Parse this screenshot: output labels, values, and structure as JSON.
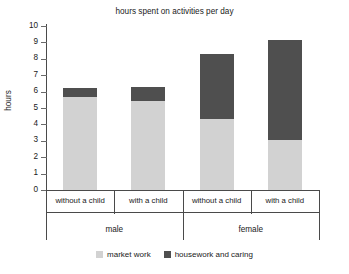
{
  "chart_data": {
    "type": "bar",
    "subtype": "stacked-bar",
    "title": "hours spent on activities per day",
    "xlabel": "",
    "ylabel": "hours",
    "ylim": [
      0,
      10
    ],
    "ytick_labels": [
      "0",
      "1",
      "2",
      "3",
      "4",
      "5",
      "6",
      "7",
      "8",
      "9",
      "10"
    ],
    "ytick_values": [
      0,
      1,
      2,
      3,
      4,
      5,
      6,
      7,
      8,
      9,
      10
    ],
    "grid": false,
    "legend_position": "bottom-center",
    "categories": [
      "without a child",
      "with a child",
      "without a child",
      "with a child"
    ],
    "groups": [
      {
        "label": "male",
        "categories": [
          "without a child",
          "with a child"
        ]
      },
      {
        "label": "female",
        "categories": [
          "without a child",
          "with a child"
        ]
      }
    ],
    "series": [
      {
        "name": "market work",
        "color": "#d2d2d2",
        "values": [
          5.65,
          5.4,
          4.35,
          3.05
        ]
      },
      {
        "name": "housework and caring",
        "color": "#4f4f4f",
        "values": [
          0.55,
          0.9,
          3.95,
          6.1
        ]
      }
    ],
    "totals": [
      6.2,
      6.3,
      8.3,
      9.15
    ]
  },
  "legend": {
    "items": [
      {
        "label": "market work",
        "color": "#d2d2d2"
      },
      {
        "label": "housework and caring",
        "color": "#4f4f4f"
      }
    ]
  }
}
